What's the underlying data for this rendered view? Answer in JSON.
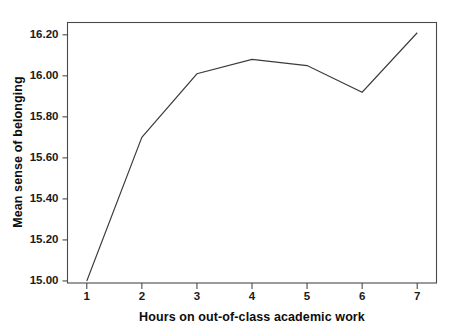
{
  "chart_data": {
    "type": "line",
    "title": "",
    "subtitle": "",
    "xlabel": "Hours on out-of-class academic work",
    "ylabel": "Mean sense of belonging",
    "x": [
      1,
      2,
      3,
      4,
      5,
      6,
      7
    ],
    "values": [
      15.0,
      15.7,
      16.01,
      16.08,
      16.05,
      15.92,
      16.21
    ],
    "series": [
      {
        "name": "Mean sense of belonging",
        "values": [
          15.0,
          15.7,
          16.01,
          16.08,
          16.05,
          15.92,
          16.21
        ]
      }
    ],
    "xtick_labels": [
      "1",
      "2",
      "3",
      "4",
      "5",
      "6",
      "7"
    ],
    "ytick_labels": [
      "15.00",
      "15.20",
      "15.40",
      "15.60",
      "15.80",
      "16.00",
      "16.20"
    ],
    "ytick_values": [
      15.0,
      15.2,
      15.4,
      15.6,
      15.8,
      16.0,
      16.2
    ],
    "xlim": [
      0.65,
      7.35
    ],
    "ylim": [
      14.99,
      16.26
    ],
    "grid": false,
    "legend": false,
    "legend_position": "none",
    "annotations": [],
    "line_color": "#3b3b3b",
    "axis_color": "#4a4a4a",
    "text_color": "#0d0d0d",
    "background_color": "#ffffff"
  },
  "figure": {
    "width": 455,
    "height": 331
  }
}
